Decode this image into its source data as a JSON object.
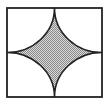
{
  "diagram": {
    "type": "geometry",
    "square": {
      "x": 7,
      "y": 8,
      "width": 95,
      "height": 89
    },
    "stroke_color": "#222222",
    "fill_color": "#b8b8b8",
    "fill_pattern": "dotted-gray",
    "background": "#ffffff"
  }
}
